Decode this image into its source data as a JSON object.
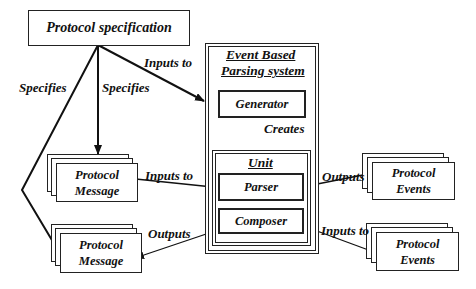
{
  "title": "Event Based Parsing system",
  "nodes": {
    "spec": {
      "label": "Protocol specification"
    },
    "system": {
      "label_line1": "Event Based",
      "label_line2": "Parsing system"
    },
    "generator": {
      "label": "Generator"
    },
    "unit": {
      "label": "Unit"
    },
    "parser": {
      "label": "Parser"
    },
    "composer": {
      "label": "Composer"
    },
    "msg_in": {
      "line1": "Protocol",
      "line2": "Message"
    },
    "msg_out": {
      "line1": "Protocol",
      "line2": "Message"
    },
    "events_out": {
      "line1": "Protocol",
      "line2": "Events"
    },
    "events_in": {
      "line1": "Protocol",
      "line2": "Events"
    }
  },
  "edges": [
    {
      "from": "spec",
      "to": "system",
      "label": "Inputs to"
    },
    {
      "from": "spec",
      "to": "msg_in",
      "label": "Specifies"
    },
    {
      "from": "spec",
      "to": "msg_out",
      "label": "Specifies"
    },
    {
      "from": "generator",
      "to": "unit",
      "label": "Creates"
    },
    {
      "from": "msg_in",
      "to": "parser",
      "label": "Inputs to"
    },
    {
      "from": "parser",
      "to": "events_out",
      "label": "Outputs"
    },
    {
      "from": "composer",
      "to": "msg_out",
      "label": "Outputs"
    },
    {
      "from": "events_in",
      "to": "composer",
      "label": "Inputs to"
    }
  ]
}
